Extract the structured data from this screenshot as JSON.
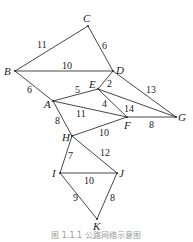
{
  "diagram": {
    "type": "weighted-undirected-graph",
    "nodes": [
      {
        "id": "C",
        "x": 88,
        "y": 26,
        "lx": 83,
        "ly": 22
      },
      {
        "id": "B",
        "x": 15,
        "y": 71,
        "lx": 4,
        "ly": 75
      },
      {
        "id": "D",
        "x": 113,
        "y": 71,
        "lx": 116,
        "ly": 74
      },
      {
        "id": "E",
        "x": 98,
        "y": 89,
        "lx": 89,
        "ly": 88
      },
      {
        "id": "A",
        "x": 53,
        "y": 101,
        "lx": 44,
        "ly": 108
      },
      {
        "id": "F",
        "x": 127,
        "y": 117,
        "lx": 124,
        "ly": 129
      },
      {
        "id": "G",
        "x": 176,
        "y": 117,
        "lx": 178,
        "ly": 121
      },
      {
        "id": "H",
        "x": 72,
        "y": 136,
        "lx": 62,
        "ly": 141
      },
      {
        "id": "I",
        "x": 60,
        "y": 173,
        "lx": 52,
        "ly": 177
      },
      {
        "id": "J",
        "x": 117,
        "y": 173,
        "lx": 119,
        "ly": 177
      },
      {
        "id": "K",
        "x": 97,
        "y": 219,
        "lx": 93,
        "ly": 230
      }
    ],
    "edges": [
      {
        "from": "B",
        "to": "C",
        "weight": "11",
        "wx": 37,
        "wy": 48
      },
      {
        "from": "C",
        "to": "D",
        "weight": "6",
        "wx": 102,
        "wy": 49
      },
      {
        "from": "B",
        "to": "D",
        "weight": "10",
        "wx": 62,
        "wy": 69
      },
      {
        "from": "B",
        "to": "A",
        "weight": "6",
        "wx": 27,
        "wy": 93
      },
      {
        "from": "D",
        "to": "E",
        "weight": "2",
        "wx": 107,
        "wy": 87
      },
      {
        "from": "D",
        "to": "G",
        "weight": "13",
        "wx": 146,
        "wy": 93
      },
      {
        "from": "A",
        "to": "E",
        "weight": "5",
        "wx": 75,
        "wy": 93
      },
      {
        "from": "E",
        "to": "F",
        "weight": "4",
        "wx": 102,
        "wy": 107
      },
      {
        "from": "E",
        "to": "G",
        "weight": "14",
        "wx": 124,
        "wy": 112
      },
      {
        "from": "A",
        "to": "F",
        "weight": "11",
        "wx": 76,
        "wy": 117
      },
      {
        "from": "F",
        "to": "G",
        "weight": "8",
        "wx": 149,
        "wy": 128
      },
      {
        "from": "A",
        "to": "H",
        "weight": "8",
        "wx": 55,
        "wy": 124
      },
      {
        "from": "H",
        "to": "F",
        "weight": "10",
        "wx": 99,
        "wy": 136
      },
      {
        "from": "H",
        "to": "I",
        "weight": "7",
        "wx": 68,
        "wy": 159
      },
      {
        "from": "H",
        "to": "J",
        "weight": "12",
        "wx": 100,
        "wy": 156
      },
      {
        "from": "I",
        "to": "J",
        "weight": "10",
        "wx": 84,
        "wy": 184
      },
      {
        "from": "I",
        "to": "K",
        "weight": "9",
        "wx": 73,
        "wy": 201
      },
      {
        "from": "J",
        "to": "K",
        "weight": "8",
        "wx": 110,
        "wy": 201
      }
    ],
    "caption": "图 1.1.1 公路网络示意图"
  }
}
